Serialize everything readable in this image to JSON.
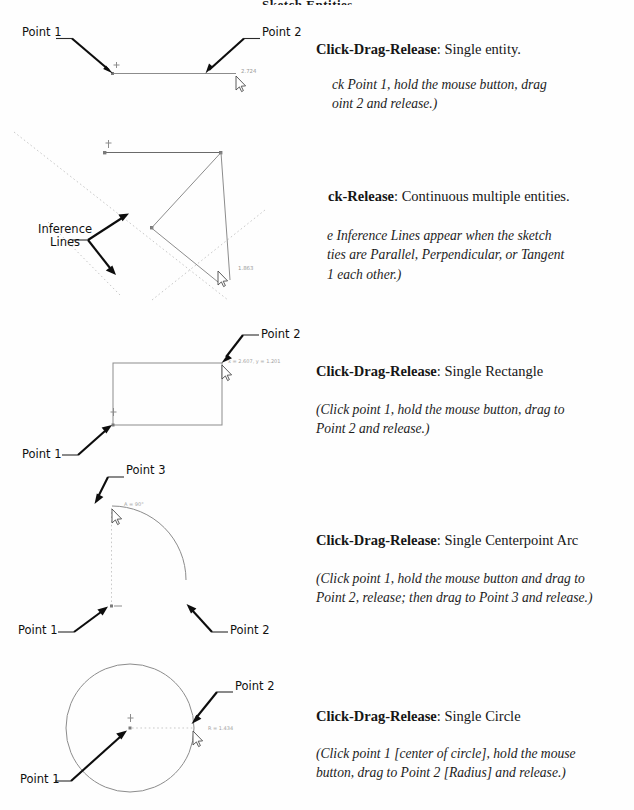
{
  "page": {
    "top_heading_clipped": "Sketch Entities"
  },
  "sections": [
    {
      "id": "line",
      "head_bold": "Click-Drag-Release",
      "head_rest": ": Single entity.",
      "body": "ck Point 1, hold the mouse button, drag\noint 2 and release.)",
      "labels": {
        "p1": "Point 1",
        "p2": "Point 2"
      },
      "dimension": "2.724"
    },
    {
      "id": "continuous",
      "head_bold": "ck-Release",
      "head_rest": ": Continuous multiple entities.",
      "body": "e Inference Lines appear when the sketch\nties are Parallel, Perpendicular, or Tangent\n1 each other.)",
      "labels": {
        "inference": "Inference\nLines",
        "inference_l1": "Inference",
        "inference_l2": "Lines"
      },
      "dimension": "1.863"
    },
    {
      "id": "rectangle",
      "head_bold": "Click-Drag-Release",
      "head_rest": ": Single Rectangle",
      "body": "(Click point 1, hold the mouse button, drag to\nPoint 2 and release.)",
      "labels": {
        "p1": "Point 1",
        "p2": "Point 2"
      },
      "dimension": "x = 2.607, y = 1.201"
    },
    {
      "id": "arc",
      "head_bold": "Click-Drag-Release",
      "head_rest": ": Single Centerpoint Arc",
      "body": "(Click point 1, hold the mouse button and drag to\nPoint 2, release; then drag to Point 3 and release.)",
      "labels": {
        "p1": "Point 1",
        "p2": "Point 2",
        "p3": "Point 3"
      },
      "dimension": "A = 90°"
    },
    {
      "id": "circle",
      "head_bold": "Click-Drag-Release",
      "head_rest": ": Single Circle",
      "body": "(Click point 1 [center of circle], hold the mouse\nbutton, drag to Point 2 [Radius] and release.)",
      "labels": {
        "p1": "Point 1",
        "p2": "Point 2"
      },
      "dimension": "R = 1.434"
    }
  ],
  "colors": {
    "sketch_line": "#8c8c8c",
    "inference_line": "#c9c9c9",
    "arrow": "#0d0d0d",
    "dimension_text": "#9a9a9a",
    "body_text": "#1c1c1c"
  }
}
